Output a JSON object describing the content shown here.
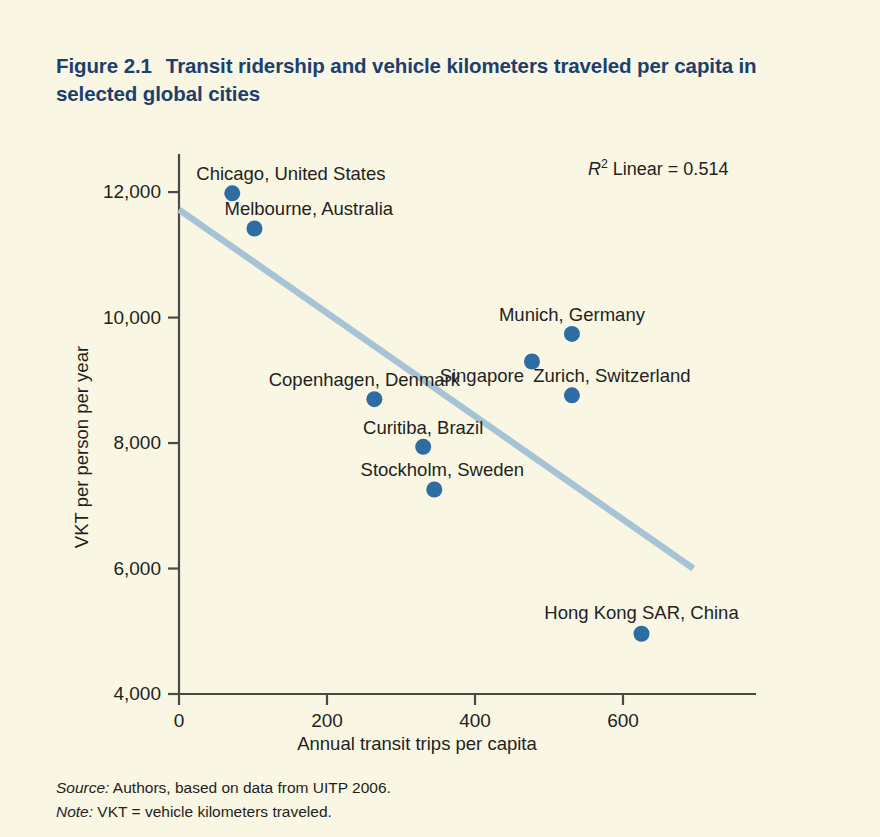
{
  "figure": {
    "number": "Figure 2.1",
    "title": "Transit ridership and vehicle kilometers traveled per capita in selected global cities"
  },
  "annotation": {
    "r2_prefix": "R",
    "r2_sup": "2",
    "r2_text": " Linear = 0.514"
  },
  "footer": {
    "source_label": "Source:",
    "source_text": " Authors, based on data from UITP 2006.",
    "note_label": "Note:",
    "note_text": " VKT = vehicle kilometers traveled."
  },
  "colors": {
    "background": "#f9f6e4",
    "title": "#1c3f6e",
    "marker": "#2e6da4",
    "trendline": "#a6c4d6",
    "axis": "#4a4a45",
    "text": "#231f20"
  },
  "chart_data": {
    "type": "scatter",
    "title": "Transit ridership and vehicle kilometers traveled per capita in selected global cities",
    "xlabel": "Annual transit trips per capita",
    "ylabel": "VKT per person per year",
    "xlim": [
      0,
      750
    ],
    "ylim": [
      4000,
      12400
    ],
    "xticks": [
      "0",
      "200",
      "400",
      "600"
    ],
    "xtick_values": [
      0,
      200,
      400,
      600
    ],
    "yticks": [
      "4,000",
      "6,000",
      "8,000",
      "10,000",
      "12,000"
    ],
    "ytick_values": [
      4000,
      6000,
      8000,
      10000,
      12000
    ],
    "grid": false,
    "legend": "none",
    "r_squared": 0.514,
    "trendline": {
      "type": "linear",
      "x_start": 0,
      "y_start": 11720,
      "x_end": 695,
      "y_end": 6000
    },
    "points": [
      {
        "label": "Chicago, United States",
        "x": 72,
        "y": 11980,
        "label_pos": "above-right",
        "label_anchor": "start",
        "label_dx": -36,
        "label_dy": -28
      },
      {
        "label": "Melbourne, Australia",
        "x": 102,
        "y": 11420,
        "label_pos": "above-right",
        "label_anchor": "start",
        "label_dx": -30,
        "label_dy": -28
      },
      {
        "label": "Munich, Germany",
        "x": 531,
        "y": 9740,
        "label_pos": "above",
        "label_anchor": "mid",
        "label_dx": 0,
        "label_dy": -28
      },
      {
        "label": "Singapore",
        "x": 477,
        "y": 9300,
        "label_pos": "left",
        "label_anchor": "end",
        "label_dx": -8,
        "label_dy": 6
      },
      {
        "label": "Zurich, Switzerland",
        "x": 531,
        "y": 8760,
        "label_pos": "above",
        "label_anchor": "mid",
        "label_dx": 40,
        "label_dy": -28
      },
      {
        "label": "Copenhagen, Denmark",
        "x": 264,
        "y": 8700,
        "label_pos": "above",
        "label_anchor": "mid",
        "label_dx": -10,
        "label_dy": -28
      },
      {
        "label": "Curitiba, Brazil",
        "x": 330,
        "y": 7940,
        "label_pos": "above",
        "label_anchor": "mid",
        "label_dx": 0,
        "label_dy": -28
      },
      {
        "label": "Stockholm, Sweden",
        "x": 345,
        "y": 7260,
        "label_pos": "above",
        "label_anchor": "mid",
        "label_dx": 8,
        "label_dy": -28
      },
      {
        "label": "Hong Kong SAR, China",
        "x": 625,
        "y": 4960,
        "label_pos": "above",
        "label_anchor": "mid",
        "label_dx": 0,
        "label_dy": -30
      }
    ]
  }
}
